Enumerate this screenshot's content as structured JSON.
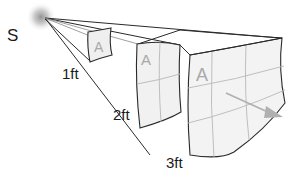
{
  "diagram": {
    "type": "inverse-square-law",
    "source": {
      "label": "S"
    },
    "distances": [
      {
        "label": "1ft"
      },
      {
        "label": "2ft"
      },
      {
        "label": "3ft"
      }
    ],
    "panels": [
      {
        "letter": "A",
        "grid": "1x1"
      },
      {
        "letter": "A",
        "grid": "2x2"
      },
      {
        "letter": "A",
        "grid": "3x3"
      }
    ],
    "colors": {
      "line": "#2a2a2a",
      "panel_fill": "#f2f2f2",
      "grid_line": "#b8b8b8",
      "letter": "#a8a8a8",
      "arrow": "#b0b0b0",
      "source_glow": "#9a9a9a"
    }
  }
}
